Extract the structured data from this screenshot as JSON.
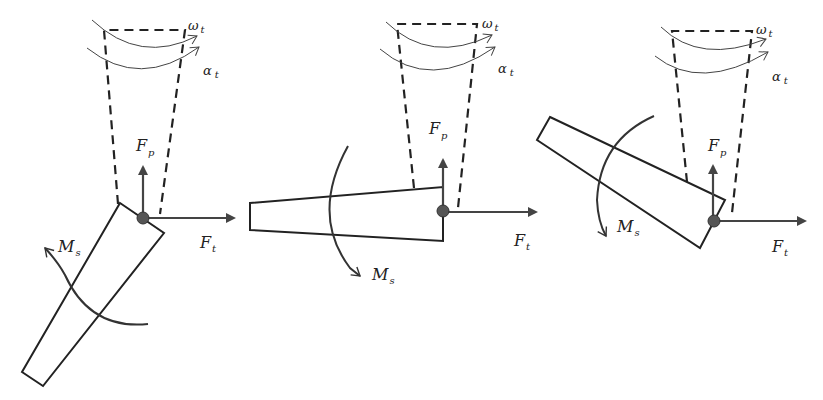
{
  "diagram": {
    "labels": {
      "omega": "ω",
      "omega_sub": "t",
      "alpha": "α",
      "alpha_sub": "t",
      "fp": "F",
      "fp_sub": "p",
      "ft": "F",
      "ft_sub": "t",
      "ms": "M",
      "ms_sub": "s"
    },
    "panels": [
      {
        "id": "panel-1",
        "orientation": "segment angled down-left"
      },
      {
        "id": "panel-2",
        "orientation": "segment horizontal pointing left"
      },
      {
        "id": "panel-3",
        "orientation": "segment angled up-left"
      }
    ],
    "colors": {
      "stroke": "#222222",
      "arrow": "#444444",
      "pivot": "#555555"
    }
  }
}
